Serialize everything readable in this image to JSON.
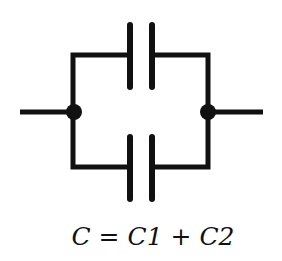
{
  "diagram": {
    "components": [
      {
        "id": "C1",
        "type": "capacitor",
        "branch": "top"
      },
      {
        "id": "C2",
        "type": "capacitor",
        "branch": "bottom"
      }
    ],
    "nodes": [
      "left-junction",
      "right-junction"
    ],
    "colors": {
      "wire": "#111111",
      "background": "#ffffff"
    }
  },
  "equation": {
    "lhs": "C",
    "equals": " = ",
    "term1": "C1",
    "plus": " + ",
    "term2": "C2"
  }
}
